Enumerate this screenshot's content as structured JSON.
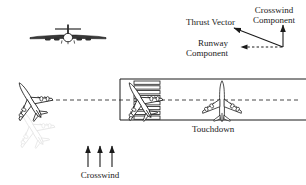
{
  "diagram": {
    "title_visible": false,
    "background": "#ffffff",
    "ink": "#1a1a1a",
    "ghost": "#c9c9c9",
    "labels": {
      "thrust_vector": "Thrust Vector",
      "crosswind_component_line1": "Crosswind",
      "crosswind_component_line2": "Component",
      "runway_component_line1": "Runway",
      "runway_component_line2": "Component",
      "touchdown": "Touchdown",
      "crosswind": "Crosswind"
    },
    "vector_triangle": {
      "origin_x": 283,
      "origin_y": 47,
      "thrust_tip_x": 232,
      "thrust_tip_y": 27,
      "crosswind_tip_x": 283,
      "crosswind_tip_y": 24,
      "runway_tip_x": 240,
      "runway_tip_y": 47,
      "thrust_style": "solid-arrow",
      "crosswind_style": "solid-arrow",
      "runway_style": "dashed-arrow"
    },
    "runway": {
      "left_x": 120,
      "right_x": 306,
      "top_y": 79,
      "bottom_y": 120,
      "centerline_y": 100,
      "centerline_start_x": 42,
      "centerline_end_x": 300,
      "centerline_style": "dashed",
      "threshold_stripe_count": 8,
      "threshold_stripe_x": 134,
      "threshold_stripe_width": 26
    },
    "aircraft": [
      {
        "name": "front-view-aircraft",
        "view": "front",
        "x": 68,
        "y": 37,
        "scale": 1.0,
        "rotation": 0,
        "color": "#1a1a1a"
      },
      {
        "name": "crabbed-approach-aircraft",
        "view": "top",
        "x": 30,
        "y": 100,
        "scale": 0.92,
        "rotation": -32,
        "color": "#1a1a1a"
      },
      {
        "name": "approach-aircraft-shadow",
        "view": "top",
        "x": 32,
        "y": 127,
        "scale": 0.92,
        "rotation": -32,
        "color": "#d2d2d2"
      },
      {
        "name": "threshold-aircraft",
        "view": "top",
        "x": 140,
        "y": 100,
        "scale": 0.92,
        "rotation": -32,
        "color": "#1a1a1a"
      },
      {
        "name": "touchdown-aircraft",
        "view": "top",
        "x": 222,
        "y": 101,
        "scale": 0.92,
        "rotation": 0,
        "color": "#1a1a1a"
      }
    ],
    "crosswind_arrows": {
      "count": 3,
      "x_positions": [
        88,
        100,
        112
      ],
      "tail_y": 167,
      "head_y": 145
    }
  }
}
